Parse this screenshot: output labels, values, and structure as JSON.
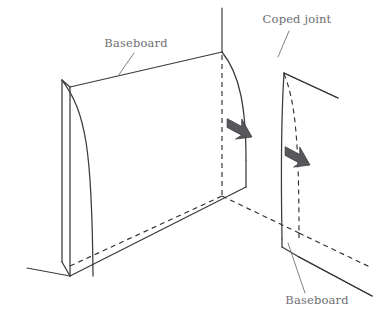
{
  "diagram": {
    "type": "technical-line-illustration",
    "background_color": "#ffffff",
    "line_color": "#3a3a3e",
    "hidden_line_color": "#2f2f33",
    "arrow_color": "#58585c",
    "label_color": "#6e6e72",
    "labels": {
      "baseboard_left": "Baseboard",
      "coped_joint": "Coped joint",
      "baseboard_right": "Baseboard"
    },
    "annotations": [
      {
        "name": "baseboard-left-label",
        "text": "Baseboard",
        "x": 136,
        "y": 47,
        "leader_from": [
          134,
          53
        ],
        "leader_to": [
          118,
          75
        ]
      },
      {
        "name": "coped-joint-label",
        "text": "Coped joint",
        "x": 296,
        "y": 23,
        "leader_from": [
          288,
          31
        ],
        "leader_to": [
          278,
          57
        ]
      },
      {
        "name": "baseboard-right-label",
        "text": "Baseboard",
        "x": 317,
        "y": 303,
        "leader_from": [
          305,
          294
        ],
        "leader_to": [
          288,
          243
        ]
      }
    ],
    "arrows": [
      {
        "name": "insertion-arrow-upper",
        "tip": [
          252,
          137
        ],
        "angle_deg": 208
      },
      {
        "name": "insertion-arrow-lower",
        "tip": [
          310,
          165
        ],
        "angle_deg": 208
      }
    ],
    "parts": {
      "left_baseboard": "solid box with curved molding profile end, meeting inside corner",
      "right_baseboard": "slab with coped curved end matching left baseboard profile",
      "hidden_edges": "dashed",
      "visible_edges": "solid"
    }
  }
}
